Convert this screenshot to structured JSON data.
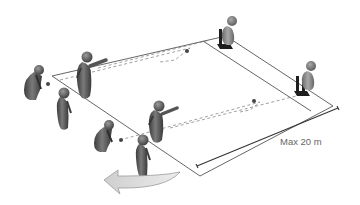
{
  "diagram": {
    "dimension_label": "Max 20 m",
    "colors": {
      "player_dark": "#4a4a4a",
      "player_light": "#8a8a8a",
      "line": "#555555",
      "arrow_fill": "#d9d9d9",
      "arrow_stroke": "#9a9a9a",
      "cone": "#1e1e1e",
      "text": "#666666"
    },
    "elements": {
      "players_count": 9,
      "cones_count": 2,
      "balls_count": 4,
      "rotation_arrow": "counter-clockwise"
    }
  }
}
